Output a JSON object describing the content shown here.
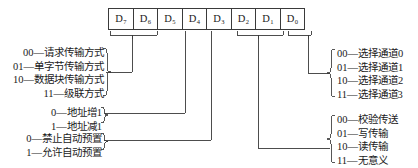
{
  "diagram": {
    "register": {
      "name": "register-byte",
      "bits": [
        {
          "label": "D",
          "index": "7"
        },
        {
          "label": "D",
          "index": "6"
        },
        {
          "label": "D",
          "index": "5"
        },
        {
          "label": "D",
          "index": "4"
        },
        {
          "label": "D",
          "index": "3"
        },
        {
          "label": "D",
          "index": "2"
        },
        {
          "label": "D",
          "index": "1"
        },
        {
          "label": "D",
          "index": "0"
        }
      ]
    },
    "annotations": {
      "mode": {
        "name": "transfer-mode-group",
        "bits": "D7-D6",
        "lines": [
          "00—请求传输方式",
          "01—单字节传输方式",
          "10—数据块传输方式",
          "11—级联方式"
        ]
      },
      "address": {
        "name": "address-direction-group",
        "bits": "D5",
        "lines": [
          "0—地址增1",
          "1—地址减1"
        ]
      },
      "preset": {
        "name": "auto-preset-group",
        "bits": "D4",
        "lines": [
          "0—禁止自动预置",
          "1—允许自动预置"
        ]
      },
      "channel": {
        "name": "channel-select-group",
        "bits": "D1-D0",
        "lines": [
          "00—选择通道0",
          "01—选择通道1",
          "10—选择通道2",
          "11—选择通道3"
        ]
      },
      "transfer": {
        "name": "transfer-type-group",
        "bits": "D3-D2",
        "lines": [
          "00—校验传送",
          "01—写传输",
          "10—读传输",
          "11—无意义"
        ]
      }
    },
    "colors": {
      "line": "#3a3a3a",
      "text": "#1a1a1a",
      "background": "#ffffff"
    }
  }
}
